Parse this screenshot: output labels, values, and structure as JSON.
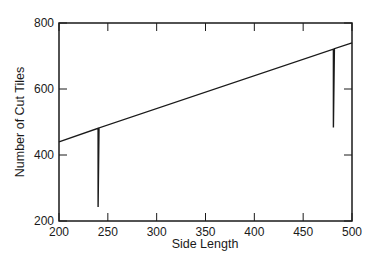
{
  "chart_data": {
    "type": "line",
    "title": "",
    "xlabel": "Side Length",
    "ylabel": "Number of Cut Tiles",
    "xlim": [
      200,
      500
    ],
    "ylim": [
      200,
      800
    ],
    "xticks": [
      200,
      250,
      300,
      350,
      400,
      450,
      500
    ],
    "yticks": [
      200,
      400,
      600,
      800
    ],
    "grid": false,
    "legend": null,
    "series": [
      {
        "name": "Number of Cut Tiles",
        "x": [
          200,
          240,
          240,
          241,
          481,
          481,
          482,
          500
        ],
        "y": [
          440,
          481,
          242,
          482,
          721,
          483,
          722,
          740
        ]
      }
    ],
    "annotations": [
      {
        "note": "downward spike near side length 240 (~482 to ~242)"
      },
      {
        "note": "downward spike near side length 481 (~722 to ~483)"
      }
    ]
  },
  "colors": {
    "line": "#1a1a1a",
    "axes": "#1a1a1a",
    "background": "#ffffff"
  }
}
